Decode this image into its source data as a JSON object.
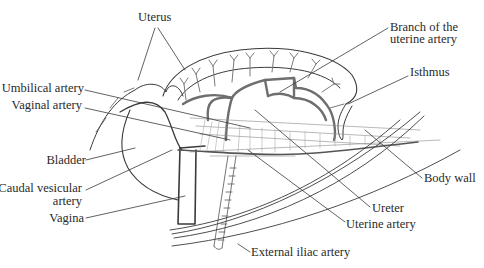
{
  "figure": {
    "labels": {
      "uterus": "Uterus",
      "branch_uterine_artery_1": "Branch of the",
      "branch_uterine_artery_2": "uterine artery",
      "isthmus": "Isthmus",
      "umbilical_artery": "Umbilical artery",
      "vaginal_artery": "Vaginal artery",
      "bladder": "Bladder",
      "caudal_vesicular_artery_1": "Caudal vesicular",
      "caudal_vesicular_artery_2": "artery",
      "vagina": "Vagina",
      "body_wall": "Body wall",
      "ureter": "Ureter",
      "uterine_artery": "Uterine artery",
      "external_iliac_artery": "External iliac artery"
    },
    "colors": {
      "line": "#3a3a3a",
      "vessel": "#7a7a7a",
      "text": "#2a2a2a",
      "background": "#ffffff"
    }
  }
}
